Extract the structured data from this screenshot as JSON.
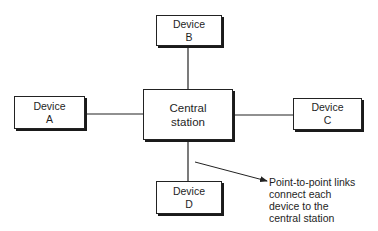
{
  "diagram": {
    "type": "star-topology",
    "nodes": {
      "central": {
        "line1": "Central",
        "line2": "station"
      },
      "device_a": {
        "line1": "Device",
        "line2": "A"
      },
      "device_b": {
        "line1": "Device",
        "line2": "B"
      },
      "device_c": {
        "line1": "Device",
        "line2": "C"
      },
      "device_d": {
        "line1": "Device",
        "line2": "D"
      }
    },
    "links": [
      {
        "from": "Device A",
        "to": "Central station"
      },
      {
        "from": "Device B",
        "to": "Central station"
      },
      {
        "from": "Device C",
        "to": "Central station"
      },
      {
        "from": "Device D",
        "to": "Central station"
      }
    ],
    "annotation": {
      "lines": [
        "Point-to-point links",
        "connect each",
        "device to the",
        "central station"
      ]
    },
    "colors": {
      "background": "#ffffff",
      "stroke": "#222222",
      "text": "#1e1e1e"
    }
  }
}
